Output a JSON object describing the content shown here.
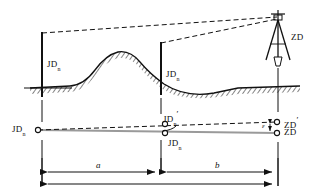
{
  "figure": {
    "type": "surveying-traverse-profile-diagram",
    "background_color": "#ffffff",
    "line_color": "#111111",
    "plan_line_color": "#9a9a9a"
  },
  "profile": {
    "ground_label": "terrain-profile",
    "poles": [
      {
        "name": "left-pole",
        "label_text": "JD",
        "label_sub": "n"
      },
      {
        "name": "middle-pole",
        "label_text": "JD",
        "label_sub": "n"
      }
    ],
    "station": {
      "name": "tripod-station",
      "label_text": "ZD"
    },
    "sight_lines": 2
  },
  "plan": {
    "points": [
      {
        "name": "jd-left",
        "label_text": "JD",
        "label_sub": "n"
      },
      {
        "name": "jd-prime",
        "label_text": "JD",
        "label_sub": "n",
        "prime": "′"
      },
      {
        "name": "jd-mid",
        "label_text": "JD",
        "label_sub": "n"
      },
      {
        "name": "zd-prime",
        "label_text": "ZD",
        "prime": "′"
      },
      {
        "name": "zd",
        "label_text": "ZD"
      }
    ],
    "offset_marker": "ε"
  },
  "dimensions": [
    {
      "name": "dimension-a",
      "label": "a"
    },
    {
      "name": "dimension-b",
      "label": "b"
    },
    {
      "name": "dimension-total",
      "label": ""
    }
  ]
}
